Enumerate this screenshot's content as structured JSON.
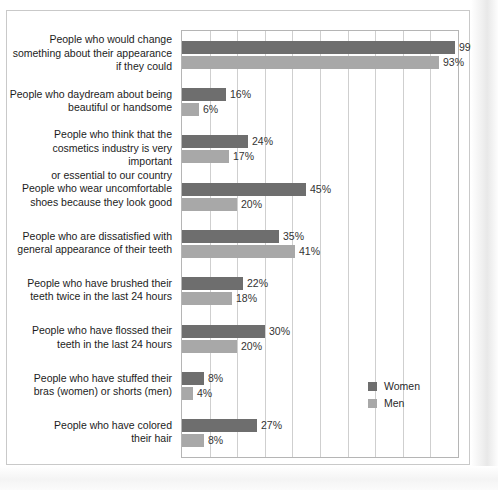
{
  "chart_data": {
    "type": "bar",
    "orientation": "horizontal",
    "title": "",
    "subtitle": "",
    "xlabel": "",
    "ylabel": "",
    "xlim": [
      0,
      100
    ],
    "xtick_interval": 10,
    "grid": true,
    "value_suffix": "%",
    "legend_position": "inside-bottom-right",
    "categories": [
      "People who would change\nsomething about their appearance\nif they could",
      "People who daydream about being\nbeautiful or handsome",
      "People who think that the\ncosmetics industry is very important\nor essential to our country",
      "People who wear uncomfortable\nshoes because they look good",
      "People who are dissatisfied with\ngeneral appearance of their teeth",
      "People who have brushed their\nteeth twice in the last 24 hours",
      "People who have flossed their\nteeth in the last 24 hours",
      "People who have stuffed their\nbras (women) or shorts (men)",
      "People who have colored\ntheir hair"
    ],
    "series": [
      {
        "name": "Women",
        "color": "#6e6e6e",
        "values": [
          99,
          16,
          24,
          45,
          35,
          22,
          30,
          8,
          27
        ],
        "labels": [
          "99%",
          "16%",
          "24%",
          "45%",
          "35%",
          "22%",
          "30%",
          "8%",
          "27%"
        ]
      },
      {
        "name": "Men",
        "color": "#a8a8a8",
        "values": [
          93,
          6,
          17,
          20,
          41,
          18,
          20,
          4,
          8
        ],
        "labels": [
          "93%",
          "6%",
          "17%",
          "20%",
          "41%",
          "18%",
          "20%",
          "4%",
          "8%"
        ]
      }
    ]
  },
  "legend": {
    "items": [
      {
        "label": "Women",
        "color": "#6e6e6e"
      },
      {
        "label": "Men",
        "color": "#a8a8a8"
      }
    ]
  },
  "colors": {
    "women": "#6e6e6e",
    "men": "#a8a8a8",
    "gridline": "#cfcfcf",
    "plot_border": "#b5b5b5",
    "frame": "#c9c9c9",
    "text": "#1c1c1c"
  }
}
